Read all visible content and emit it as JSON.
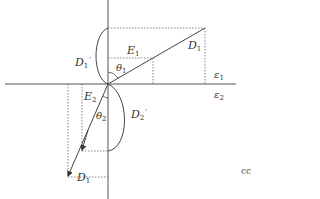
{
  "diagram": {
    "colors": {
      "line": "#444444",
      "dotted": "#555555",
      "background": "#ffffff"
    },
    "labels": {
      "D1_prime": {
        "base": "D",
        "sub": "1",
        "prime": "′"
      },
      "E1": {
        "base": "E",
        "sub": "1"
      },
      "D1_upper": {
        "base": "D",
        "sub": "1"
      },
      "theta1": {
        "base": "θ",
        "sub": "1"
      },
      "eps1": {
        "base": "ε",
        "sub": "1"
      },
      "eps2": {
        "base": "ε",
        "sub": "2"
      },
      "E2": {
        "base": "E",
        "sub": "2"
      },
      "theta2": {
        "base": "θ",
        "sub": "2"
      },
      "D2_prime": {
        "base": "D",
        "sub": "2",
        "prime": "′"
      },
      "D1_lower": {
        "base": "D",
        "sub": "1"
      },
      "edge_text": "cc"
    }
  }
}
